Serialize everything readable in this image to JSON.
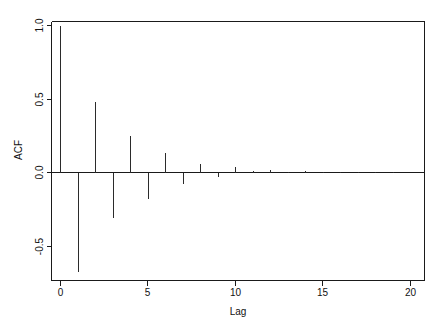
{
  "chart_data": {
    "type": "bar",
    "title": "",
    "subtitle": "",
    "xlabel": "Lag",
    "ylabel": "ACF",
    "x": [
      0,
      1,
      2,
      3,
      4,
      5,
      6,
      7,
      8,
      9,
      10,
      11,
      12,
      13,
      14,
      15,
      16,
      17,
      18,
      19,
      20
    ],
    "values": [
      1.0,
      -0.68,
      0.48,
      -0.31,
      0.25,
      -0.18,
      0.13,
      -0.08,
      0.06,
      -0.03,
      0.035,
      0.01,
      0.015,
      0.005,
      0.008,
      0.004,
      0.002,
      0.002,
      0.001,
      0.001,
      0.0
    ],
    "categories": [
      "0",
      "1",
      "2",
      "3",
      "4",
      "5",
      "6",
      "7",
      "8",
      "9",
      "10",
      "11",
      "12",
      "13",
      "14",
      "15",
      "16",
      "17",
      "18",
      "19",
      "20"
    ],
    "series": [
      {
        "name": "ACF",
        "values": [
          1.0,
          -0.68,
          0.48,
          -0.31,
          0.25,
          -0.18,
          0.13,
          -0.08,
          0.06,
          -0.03,
          0.035,
          0.01,
          0.015,
          0.005,
          0.008,
          0.004,
          0.002,
          0.002,
          0.001,
          0.001,
          0.0
        ]
      }
    ],
    "xlim": [
      -0.6,
      21.0
    ],
    "ylim": [
      -0.78,
      1.06
    ],
    "xticks": [
      0,
      5,
      10,
      15,
      20
    ],
    "xticklabels": [
      "0",
      "5",
      "10",
      "15",
      "20"
    ],
    "yticks": [
      1.0,
      0.5,
      0.0,
      -0.5
    ],
    "yticklabels": [
      "1.0",
      "0.5",
      "0.0",
      "-0.5"
    ],
    "grid": false,
    "legend": false,
    "legend_position": "none",
    "zero_reference_line": 0.0,
    "confidence_bands": false,
    "line_color": "#2b2b2b",
    "axis_color": "#1a1a1a",
    "background_color": "#ffffff"
  },
  "axes": {
    "x_title": "Lag",
    "y_title": "ACF"
  }
}
